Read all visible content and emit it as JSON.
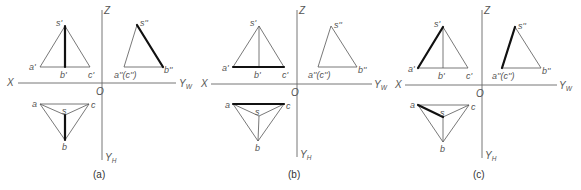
{
  "figure": {
    "panels": [
      {
        "id": "a",
        "caption": "(a)",
        "highlighted_edge": "SB",
        "axes": {
          "x": "X",
          "z": "Z",
          "yw": "Y",
          "yw_sub": "W",
          "yh": "Y",
          "yh_sub": "H",
          "origin": "O"
        },
        "front_view": {
          "s": "s'",
          "a": "a'",
          "b": "b'",
          "c": "c'"
        },
        "side_view": {
          "s": "s''",
          "ac": "a''(c'')",
          "b": "b''"
        },
        "top_view": {
          "s": "s",
          "a": "a",
          "b": "b",
          "c": "c"
        }
      },
      {
        "id": "b",
        "caption": "(b)",
        "highlighted_edge": "AC",
        "axes": {
          "x": "X",
          "z": "Z",
          "yw": "Y",
          "yw_sub": "W",
          "yh": "Y",
          "yh_sub": "H",
          "origin": "O"
        },
        "front_view": {
          "s": "s'",
          "a": "a'",
          "b": "b'",
          "c": "c'"
        },
        "side_view": {
          "s": "s''",
          "ac": "a''(c'')",
          "b": "b''"
        },
        "top_view": {
          "s": "s",
          "a": "a",
          "b": "b",
          "c": "c"
        }
      },
      {
        "id": "c",
        "caption": "(c)",
        "highlighted_edge": "SA",
        "axes": {
          "x": "X",
          "z": "Z",
          "yw": "Y",
          "yw_sub": "W",
          "yh": "Y",
          "yh_sub": "H",
          "origin": "O"
        },
        "front_view": {
          "s": "s'",
          "a": "a'",
          "b": "b'",
          "c": "c'"
        },
        "side_view": {
          "s": "s''",
          "ac": "a''(c'')",
          "b": "b''"
        },
        "top_view": {
          "s": "s",
          "a": "a",
          "b": "b",
          "c": "c"
        }
      }
    ],
    "colors": {
      "line": "#555555",
      "highlight": "#111111",
      "background": "#ffffff"
    }
  }
}
